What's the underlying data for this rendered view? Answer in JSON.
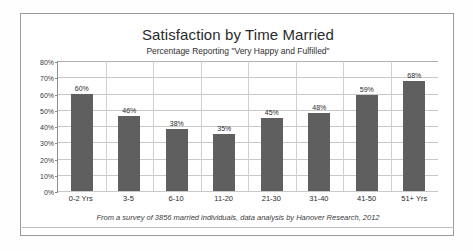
{
  "chart_data": {
    "type": "bar",
    "title": "Satisfaction by Time Married",
    "subtitle": "Percentage Reporting \"Very Happy and Fulfilled\"",
    "categories": [
      "0-2 Yrs",
      "3-5",
      "6-10",
      "11-20",
      "21-30",
      "31-40",
      "41-50",
      "51+ Yrs"
    ],
    "values": [
      60,
      46,
      38,
      35,
      45,
      48,
      59,
      68
    ],
    "value_labels": [
      "60%",
      "46%",
      "38%",
      "35%",
      "45%",
      "48%",
      "59%",
      "68%"
    ],
    "xlabel": "",
    "ylabel": "",
    "ylim": [
      0,
      80
    ],
    "ytick_values": [
      80,
      70,
      60,
      50,
      40,
      30,
      20,
      10,
      0
    ],
    "ytick_labels": [
      "80%",
      "70%",
      "60%",
      "50%",
      "40%",
      "30%",
      "20%",
      "10%",
      "0%"
    ],
    "grid": true,
    "legend": false,
    "bar_color": "#5f5f5f",
    "gridline_color": "#c9c9c9",
    "axis_color": "#8d8d8d",
    "footnote": "From a survey of 3856 married individuals, data analysis by Hanover Research, 2012"
  }
}
